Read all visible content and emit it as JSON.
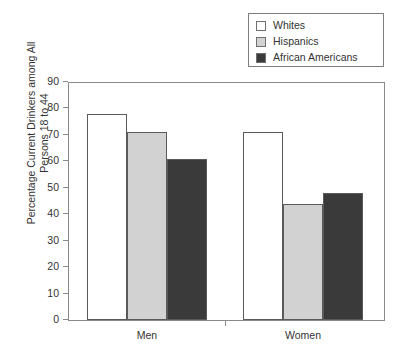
{
  "chart_data": {
    "type": "bar",
    "title": "",
    "subtitle": "",
    "xlabel": "",
    "ylabel": "Percentage Current Drinkers among All Persons 18 to 44",
    "ylabel_lines": [
      "Percentage Current Drinkers among All",
      "Persons 18 to 44"
    ],
    "categories": [
      "Men",
      "Women"
    ],
    "series": [
      {
        "name": "Whites",
        "values": [
          78,
          71
        ],
        "color": "#ffffff"
      },
      {
        "name": "Hispanics",
        "values": [
          71,
          44
        ],
        "color": "#d2d2d2"
      },
      {
        "name": "African Americans",
        "values": [
          61,
          48
        ],
        "color": "#3a3a3a"
      }
    ],
    "ylim": [
      0,
      90
    ],
    "ytick_values": [
      0,
      10,
      20,
      30,
      40,
      50,
      60,
      70,
      80,
      90
    ],
    "ytick_labels": [
      "0",
      "10",
      "20",
      "30",
      "40",
      "50",
      "60",
      "70",
      "80",
      "90"
    ],
    "grid": false,
    "legend_position": "top-right",
    "bar_border_color": "#5a5a5a",
    "axis_color": "#8a8a8a"
  },
  "legend": {
    "items": [
      {
        "label": "Whites",
        "color": "#ffffff"
      },
      {
        "label": "Hispanics",
        "color": "#d2d2d2"
      },
      {
        "label": "African Americans",
        "color": "#3a3a3a"
      }
    ]
  }
}
